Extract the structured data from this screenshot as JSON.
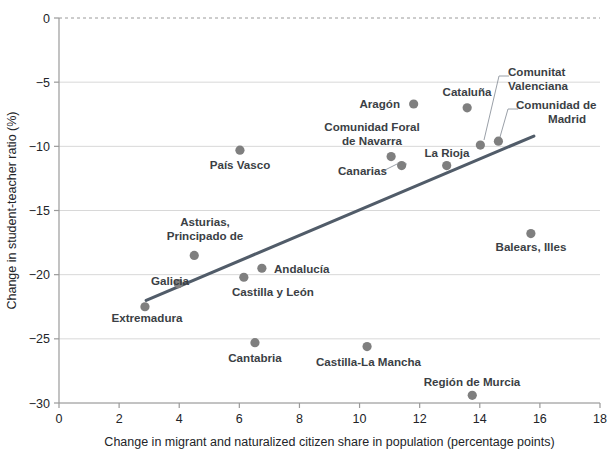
{
  "chart_data": {
    "type": "scatter",
    "title": "",
    "xlabel": "Change in migrant and naturalized citizen share in population (percentage points)",
    "ylabel": "Change in student-teacher ratio (%)",
    "xlim": [
      0,
      18
    ],
    "ylim": [
      -30,
      0
    ],
    "xticks": [
      "0",
      "2",
      "4",
      "6",
      "8",
      "10",
      "12",
      "14",
      "16",
      "18"
    ],
    "yticks": [
      "0",
      "-5",
      "-10",
      "-15",
      "-20",
      "-25",
      "-30"
    ],
    "grid": true,
    "legend": "none",
    "point_color": "#7f7f7f",
    "trendline_color": "#515c69",
    "trendline": {
      "x0": 2.9,
      "y0": -22.0,
      "x1": 15.8,
      "y1": -9.2
    },
    "points": [
      {
        "label": "Extremadura",
        "x": 2.86,
        "y": -22.5,
        "lx": 147,
        "ly": 322,
        "anchor": "middle",
        "leader": false
      },
      {
        "label": "Galicia",
        "x": 3.97,
        "y": -20.7,
        "lx": 151,
        "ly": 285,
        "anchor": "start",
        "leader": false
      },
      {
        "label": "Asturias,",
        "x": 4.5,
        "y": -18.5,
        "lx": 205,
        "ly": 226,
        "anchor": "middle",
        "leader": false
      },
      {
        "label": "Principado de",
        "x": null,
        "y": null,
        "lx": 205,
        "ly": 240,
        "anchor": "middle",
        "leader": false
      },
      {
        "label": "País Vasco",
        "x": 6.02,
        "y": -10.3,
        "lx": 240,
        "ly": 169,
        "anchor": "middle",
        "leader": false
      },
      {
        "label": "Castilla y León",
        "x": 6.15,
        "y": -20.2,
        "lx": 232,
        "ly": 296,
        "anchor": "start",
        "leader": false
      },
      {
        "label": "Cantabria",
        "x": 6.52,
        "y": -25.3,
        "lx": 255,
        "ly": 362,
        "anchor": "middle",
        "leader": false
      },
      {
        "label": "Andalucía",
        "x": 6.75,
        "y": -19.5,
        "lx": 274,
        "ly": 273,
        "anchor": "start",
        "leader": false
      },
      {
        "label": "Castilla-La Mancha",
        "x": 10.25,
        "y": -25.6,
        "lx": 316,
        "ly": 366,
        "anchor": "start",
        "leader": false
      },
      {
        "label": "Comunidad Foral",
        "x": 11.05,
        "y": -10.8,
        "lx": 372,
        "ly": 131,
        "anchor": "middle",
        "leader": false
      },
      {
        "label": "de Navarra",
        "x": null,
        "y": null,
        "lx": 372,
        "ly": 145,
        "anchor": "middle",
        "leader": false
      },
      {
        "label": "Canarias",
        "x": 11.4,
        "y": -11.5,
        "lx": 338,
        "ly": 175,
        "anchor": "start",
        "leader": true,
        "l_x1": 383,
        "l_y1": 171,
        "l_x2": 397,
        "l_y2": 164
      },
      {
        "label": "Aragón",
        "x": 11.8,
        "y": -6.7,
        "lx": 400,
        "ly": 108,
        "anchor": "end",
        "leader": false
      },
      {
        "label": "La Rioja",
        "x": 12.9,
        "y": -11.5,
        "lx": 447,
        "ly": 157,
        "anchor": "middle",
        "leader": false
      },
      {
        "label": "Cataluña",
        "x": 13.58,
        "y": -7.0,
        "lx": 467,
        "ly": 96,
        "anchor": "middle",
        "leader": false
      },
      {
        "label": "Región de Murcia",
        "x": 13.75,
        "y": -29.4,
        "lx": 472,
        "ly": 386,
        "anchor": "middle",
        "leader": false
      },
      {
        "label": "Comunitat",
        "x": 14.02,
        "y": -9.9,
        "lx": 508,
        "ly": 76,
        "anchor": "start",
        "leader": true,
        "l_x1": 484,
        "l_y1": 140,
        "l_x2": 499,
        "l_y2": 76
      },
      {
        "label": "Valenciana",
        "x": null,
        "y": null,
        "lx": 508,
        "ly": 90,
        "anchor": "start",
        "leader": false
      },
      {
        "label": "Comunidad de",
        "x": 14.62,
        "y": -9.6,
        "lx": 516,
        "ly": 109,
        "anchor": "start",
        "leader": true,
        "l_x1": 500,
        "l_y1": 137,
        "l_x2": 508,
        "l_y2": 109
      },
      {
        "label": "Madrid",
        "x": null,
        "y": null,
        "lx": 548,
        "ly": 123,
        "anchor": "start",
        "leader": false
      },
      {
        "label": "Balears, Illes",
        "x": 15.7,
        "y": -16.8,
        "lx": 531,
        "ly": 251,
        "anchor": "middle",
        "leader": false
      }
    ]
  },
  "axes": {
    "x_title": "Change in migrant and naturalized citizen share in population (percentage points)",
    "y_title": "Change in student-teacher ratio (%)"
  }
}
